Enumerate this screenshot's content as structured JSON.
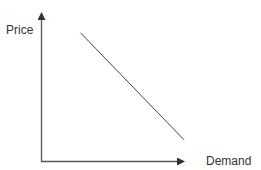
{
  "chart_data": {
    "type": "line",
    "title": "",
    "xlabel": "Demand",
    "ylabel": "Price",
    "grid": false,
    "legend": null,
    "ticks": {
      "x": [],
      "y": []
    },
    "series": [
      {
        "name": "Demand curve",
        "points": [
          {
            "x": 0.27,
            "y": 0.85
          },
          {
            "x": 0.98,
            "y": 0.14
          }
        ]
      }
    ],
    "xlim": [
      0,
      1
    ],
    "ylim": [
      0,
      1
    ]
  },
  "colors": {
    "axis": "#555555",
    "line": "#444444",
    "text": "#333333",
    "background": "#ffffff"
  }
}
